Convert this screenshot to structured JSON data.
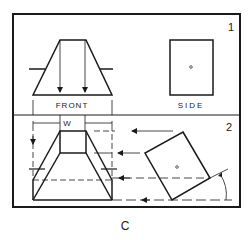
{
  "figure": {
    "caption": "C",
    "panels": [
      {
        "number": "1",
        "views": [
          {
            "label": "FRONT"
          },
          {
            "label": "SIDE"
          }
        ]
      },
      {
        "number": "2",
        "dimension_label": "W"
      }
    ]
  },
  "colors": {
    "ink": "#1a1a1a",
    "background": "#ffffff"
  }
}
